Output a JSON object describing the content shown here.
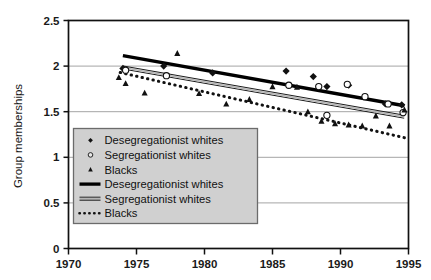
{
  "chart_data": {
    "type": "scatter",
    "title": "",
    "xlabel": "",
    "ylabel": "Group memberships",
    "xlim": [
      1970,
      1995
    ],
    "ylim": [
      0,
      2.5
    ],
    "xticks": [
      1970,
      1975,
      1980,
      1985,
      1990,
      1995
    ],
    "xtick_labels": [
      "1970",
      "1975",
      "1980",
      "1985",
      "1990",
      "1995"
    ],
    "yticks": [
      0,
      0.5,
      1,
      1.5,
      2,
      2.5
    ],
    "ytick_labels": [
      "0",
      "0.5",
      "1",
      "1.5",
      "2",
      "2.5"
    ],
    "grid": "horizontal",
    "legend_position": "lower-left-inside",
    "series": [
      {
        "name": "Desegregationist whites",
        "marker": "filled-diamond",
        "kind": "points",
        "color": "#111111",
        "points": [
          {
            "x": 1974.0,
            "y": 1.975
          },
          {
            "x": 1977.0,
            "y": 2.0
          },
          {
            "x": 1980.6,
            "y": 1.925
          },
          {
            "x": 1986.0,
            "y": 1.945
          },
          {
            "x": 1988.0,
            "y": 1.885
          },
          {
            "x": 1989.0,
            "y": 1.775
          },
          {
            "x": 1990.6,
            "y": 1.79
          },
          {
            "x": 1993.3,
            "y": 1.585
          },
          {
            "x": 1994.5,
            "y": 1.575
          }
        ]
      },
      {
        "name": "Segregationist whites",
        "marker": "open-circle",
        "kind": "points",
        "color": "#111111",
        "points": [
          {
            "x": 1974.2,
            "y": 1.955
          },
          {
            "x": 1977.2,
            "y": 1.895
          },
          {
            "x": 1986.2,
            "y": 1.79
          },
          {
            "x": 1988.4,
            "y": 1.775
          },
          {
            "x": 1989.0,
            "y": 1.46
          },
          {
            "x": 1990.5,
            "y": 1.8
          },
          {
            "x": 1991.8,
            "y": 1.665
          },
          {
            "x": 1993.5,
            "y": 1.585
          },
          {
            "x": 1994.6,
            "y": 1.49
          }
        ]
      },
      {
        "name": "Blacks",
        "marker": "filled-triangle",
        "kind": "points",
        "color": "#111111",
        "points": [
          {
            "x": 1973.7,
            "y": 1.875
          },
          {
            "x": 1974.2,
            "y": 1.81
          },
          {
            "x": 1975.6,
            "y": 1.705
          },
          {
            "x": 1978.0,
            "y": 2.14
          },
          {
            "x": 1979.6,
            "y": 1.7
          },
          {
            "x": 1981.6,
            "y": 1.585
          },
          {
            "x": 1983.3,
            "y": 1.635
          },
          {
            "x": 1985.0,
            "y": 1.775
          },
          {
            "x": 1986.8,
            "y": 1.77
          },
          {
            "x": 1987.6,
            "y": 1.5
          },
          {
            "x": 1988.6,
            "y": 1.395
          },
          {
            "x": 1989.6,
            "y": 1.37
          },
          {
            "x": 1990.6,
            "y": 1.355
          },
          {
            "x": 1991.6,
            "y": 1.345
          },
          {
            "x": 1992.6,
            "y": 1.455
          },
          {
            "x": 1993.6,
            "y": 1.345
          },
          {
            "x": 1994.7,
            "y": 1.52
          }
        ]
      },
      {
        "name": "Desegregationist  whites",
        "kind": "trendline",
        "style": "thick-solid",
        "color": "#000000",
        "x0": 1974.0,
        "y0": 2.115,
        "x1": 1994.7,
        "y1": 1.565
      },
      {
        "name": "Segregationist whites",
        "kind": "trendline",
        "style": "double-gray",
        "color": "#8a8a8a",
        "x0": 1974.0,
        "y0": 1.985,
        "x1": 1994.7,
        "y1": 1.445
      },
      {
        "name": "Blacks",
        "kind": "trendline",
        "style": "dotted",
        "color": "#111111",
        "x0": 1973.8,
        "y0": 1.93,
        "x1": 1994.7,
        "y1": 1.215
      }
    ],
    "legend_entries": [
      {
        "label": "Desegregationist whites",
        "marker": "filled-diamond"
      },
      {
        "label": "Segregationist whites",
        "marker": "open-circle"
      },
      {
        "label": "Blacks",
        "marker": "filled-triangle"
      },
      {
        "label": "Desegregationist  whites",
        "marker": "thick-solid-line"
      },
      {
        "label": "Segregationist whites",
        "marker": "double-gray-line"
      },
      {
        "label": "Blacks",
        "marker": "dotted-line"
      }
    ],
    "colors": {
      "axis": "#111111",
      "grid": "#9a9a9a",
      "legend_background": "#d0d0d0",
      "legend_border": "#6b6b6b",
      "marker": "#111111",
      "trend_deseg": "#000000",
      "trend_seg": "#8a8a8a",
      "trend_black": "#111111"
    }
  }
}
